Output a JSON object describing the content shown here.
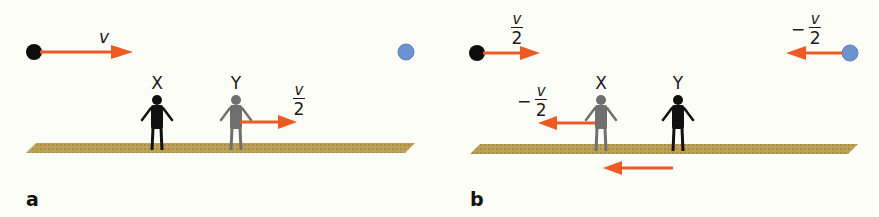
{
  "colors": {
    "background": "#fdfdf8",
    "arrow": "#ee5a24",
    "black_ball": "#0d0d0d",
    "blue_ball": "#6c93cf",
    "floor": "#b59a4e",
    "observer_inertial": "#111111",
    "observer_moving": "#6f6f6f"
  },
  "panels": [
    {
      "id": "a",
      "label": "a",
      "black_ball_velocity": "v",
      "blue_ball_velocity": "",
      "observer_x_label": "X",
      "observer_y_label": "Y",
      "observer_y_velocity": {
        "sign": "",
        "numerator": "v",
        "denominator": "2"
      }
    },
    {
      "id": "b",
      "label": "b",
      "black_ball_velocity": {
        "sign": "",
        "numerator": "v",
        "denominator": "2"
      },
      "blue_ball_velocity": {
        "sign": "−",
        "numerator": "v",
        "denominator": "2"
      },
      "observer_x_label": "X",
      "observer_y_label": "Y",
      "observer_x_velocity": {
        "sign": "−",
        "numerator": "v",
        "denominator": "2"
      },
      "floor_motion": "leftward arrow"
    }
  ]
}
